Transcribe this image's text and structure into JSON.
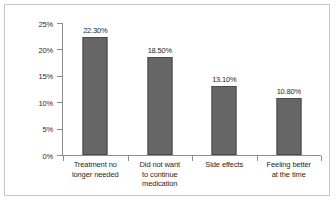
{
  "chart_data": {
    "type": "bar",
    "title": "",
    "xlabel": "",
    "ylabel": "Patients Reporting Reason",
    "ylim": [
      0,
      25
    ],
    "grid": false,
    "legend": "none",
    "categories": [
      "Treatment no longer needed",
      "Did not want to continue medication",
      "Side effects",
      "Feeling better at the time"
    ],
    "category_lines": [
      [
        "Treatment no",
        "longer needed"
      ],
      [
        "Did not want",
        "to continue",
        "medication"
      ],
      [
        "Side effects"
      ],
      [
        "Feeling better",
        "at the time"
      ]
    ],
    "values": [
      22.3,
      18.5,
      13.1,
      10.8
    ],
    "value_labels": [
      "22.30%",
      "18.50%",
      "13.10%",
      "10.80%"
    ],
    "yticks": [
      25,
      20,
      15,
      10,
      5,
      0
    ],
    "ytick_labels": [
      "25%",
      "20%",
      "15%",
      "10%",
      "5%",
      "0%"
    ],
    "colors": {
      "bar_fill": "#666666",
      "bar_border": "#4a4a4a",
      "axis": "#8c8c8c",
      "frame": "#c9c9c9",
      "text": "#1f1f1f",
      "background": "#ffffff"
    }
  }
}
